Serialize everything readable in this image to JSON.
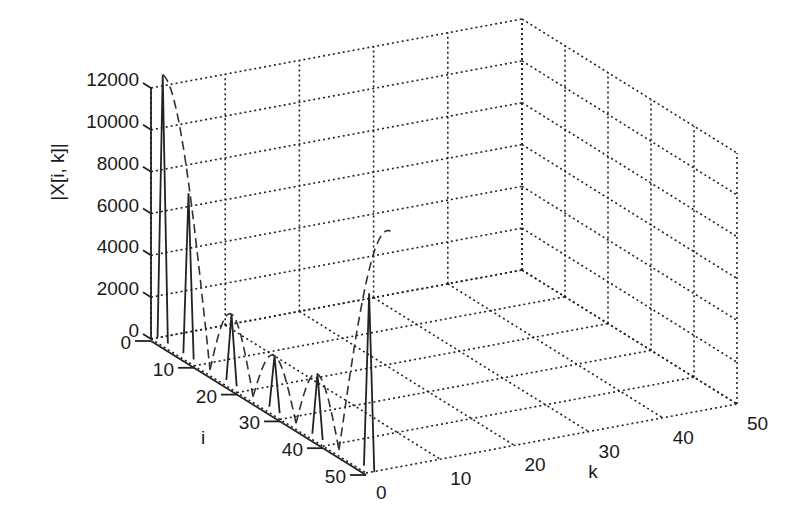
{
  "chart_data": {
    "type": "3d-line",
    "title": "",
    "xlabel": "k",
    "ylabel": "i",
    "zlabel": "|X[i, k]|",
    "x_ticks": [
      "0",
      "10",
      "20",
      "30",
      "40",
      "50"
    ],
    "y_ticks": [
      "0",
      "10",
      "20",
      "30",
      "40",
      "50"
    ],
    "z_ticks": [
      "0",
      "2000",
      "4000",
      "6000",
      "8000",
      "10000",
      "12000"
    ],
    "xlim": [
      0,
      50
    ],
    "ylim": [
      0,
      50
    ],
    "zlim": [
      0,
      12000
    ],
    "grid": true,
    "series": [
      {
        "name": "spikes",
        "style": "solid",
        "points": [
          {
            "i": 1,
            "k": 1,
            "value": 12700
          },
          {
            "i": 7,
            "k": 1,
            "value": 7800
          },
          {
            "i": 17,
            "k": 1,
            "value": 3300
          },
          {
            "i": 27,
            "k": 1,
            "value": 2600
          },
          {
            "i": 37,
            "k": 1,
            "value": 3000
          },
          {
            "i": 49,
            "k": 1,
            "value": 8400
          }
        ]
      },
      {
        "name": "envelope",
        "style": "dashed",
        "description": "dashed lobed envelope |sin|-shaped through spike tops",
        "lobes": [
          {
            "i_start": 1,
            "i_end": 12,
            "peak": 12700
          },
          {
            "i_start": 12,
            "i_end": 22,
            "peak": 3300
          },
          {
            "i_start": 22,
            "i_end": 32,
            "peak": 2600
          },
          {
            "i_start": 32,
            "i_end": 42,
            "peak": 3000
          },
          {
            "i_start": 42,
            "i_end": 54,
            "peak": 12000
          }
        ]
      }
    ]
  },
  "labels": {
    "z_axis": "|X[i, k]|",
    "i_axis": "i",
    "k_axis": "k"
  }
}
